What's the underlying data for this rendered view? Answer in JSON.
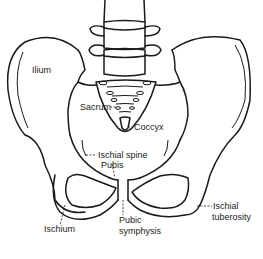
{
  "diagram": {
    "labels": {
      "ilium": "Ilium",
      "sacrum": "Sacrum",
      "coccyx": "Coccyx",
      "ischial_spine": "Ischial spine",
      "pubis": "Pubis",
      "ischium": "Ischium",
      "pubic_symphysis_line1": "Pubic",
      "pubic_symphysis_line2": "symphysis",
      "ischial_tuberosity_line1": "Ischial",
      "ischial_tuberosity_line2": "tuberosity"
    },
    "colors": {
      "line": "#1a1a1a",
      "background": "#ffffff"
    }
  }
}
